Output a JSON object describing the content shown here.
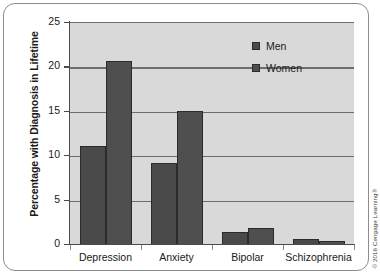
{
  "chart_data": {
    "type": "bar",
    "title": "",
    "xlabel": "",
    "ylabel": "Percentage with Diagnosis in Lifetime",
    "categories": [
      "Depression",
      "Anxiety",
      "Bipolar",
      "Schizophrenia"
    ],
    "series": [
      {
        "name": "Men",
        "values": [
          11.2,
          9.2,
          1.5,
          0.7
        ]
      },
      {
        "name": "Women",
        "values": [
          20.7,
          15.1,
          1.9,
          0.4
        ]
      }
    ],
    "ylim": [
      0,
      25
    ],
    "yticks": [
      0,
      5,
      10,
      15,
      20,
      25
    ],
    "ytick_labels": [
      "0",
      "5",
      "10",
      "15",
      "20",
      "25"
    ],
    "grid": true,
    "grid_axis": "y",
    "legend_position": "upper right",
    "legend": [
      "Men",
      "Women"
    ],
    "plot_background": "#d9d9d9",
    "colors": {
      "men": "#4a4a4a",
      "women": "#4f4f4f",
      "gridline": "#6e6e6e",
      "axis": "#4a4a4a"
    }
  },
  "credit": {
    "text": "© 2016 Cengage Learning®"
  }
}
